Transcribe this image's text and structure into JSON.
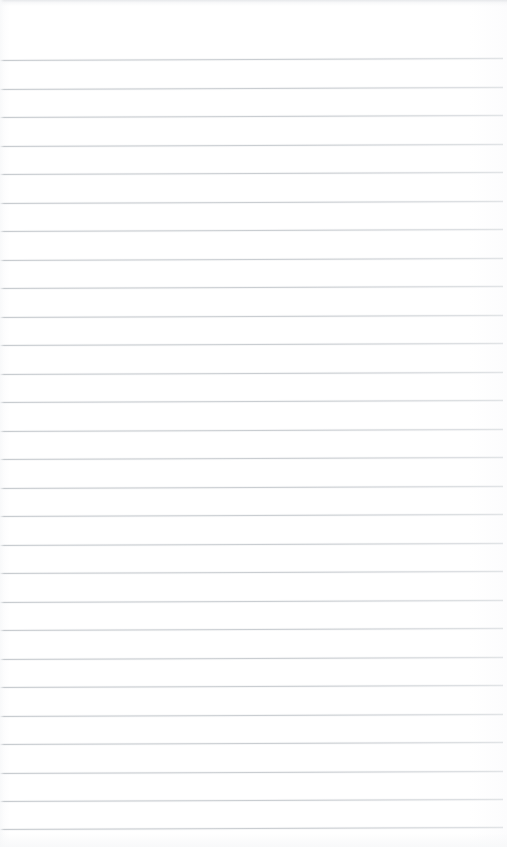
{
  "document": {
    "kind": "blank-ruled-paper-scan",
    "width": 507,
    "height": 847,
    "background_color": "#fefefe",
    "has_text_content": "false",
    "has_margin_rule": "false",
    "has_holes": "false"
  },
  "ruling": {
    "line_color": "#c9cdd1",
    "line_thickness_px": 1,
    "line_spacing_px": 28.5,
    "first_line_y": 60,
    "last_line_y": 829,
    "line_count": 28,
    "line_start_x": 0,
    "line_end_x": 503,
    "skew_degrees": -0.22,
    "lines_y": [
      60,
      88.5,
      117,
      145.5,
      174,
      202.5,
      231,
      259.5,
      288,
      316.5,
      345,
      373.5,
      402,
      430.5,
      459,
      487.5,
      516,
      544.5,
      573,
      601.5,
      630,
      658.5,
      687,
      715.5,
      744,
      772.5,
      801,
      829
    ]
  },
  "artifacts": {
    "top_edge_band_color": "#e2e4e7",
    "top_edge_band_height": 6,
    "left_edge_band_color": "#f8f9fa",
    "left_edge_band_width": 4,
    "right_fade": "true"
  },
  "writing_area": {
    "top_margin_px": 60,
    "label": ""
  }
}
